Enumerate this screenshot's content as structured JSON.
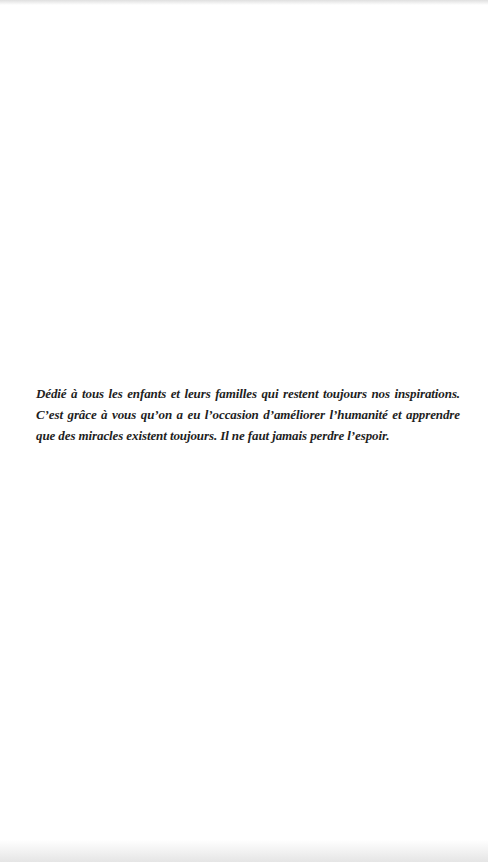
{
  "page": {
    "background_color": "#ffffff",
    "text_color": "#1e1e1e",
    "edge_shade_color": "#e6e6e6"
  },
  "dedication": {
    "lines": [
      "Dédié à tous les enfants et leurs familles qui restent toujours nos inspirations.",
      "C’est grâce à vous qu’on a eu l’occasion d’améliorer l’humanité et apprendre",
      "que des miracles existent toujours. Il ne faut jamais perdre l’espoir."
    ]
  }
}
